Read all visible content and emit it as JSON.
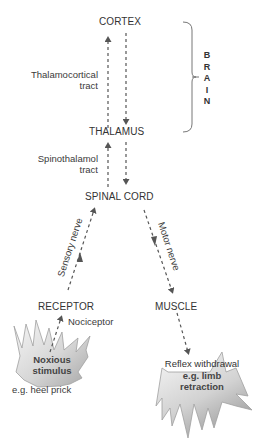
{
  "nodes": {
    "cortex": "CORTEX",
    "thalamus": "THALAMUS",
    "spinal_cord": "SPINAL CORD",
    "receptor": "RECEPTOR",
    "muscle": "MUSCLE"
  },
  "tracts": {
    "thalamocortical_line1": "Thalamocortical",
    "thalamocortical_line2": "tract",
    "spinothalamic_line1": "Spinothalamol",
    "spinothalamic_line2": "tract",
    "sensory_nerve": "Sensory nerve",
    "motor_nerve": "Motor nerve"
  },
  "brain_group": {
    "letters": [
      "B",
      "R",
      "A",
      "I",
      "N"
    ]
  },
  "stimulus": {
    "nociceptor": "Nociceptor",
    "line1": "Noxious",
    "line2": "stimulus",
    "example": "e.g. heel prick"
  },
  "response": {
    "line1": "Reflex withdrawal",
    "line2": "e.g. limb",
    "line3": "retraction"
  },
  "colors": {
    "arrow": "#555555",
    "burst_fill_light": "#f4f4f4",
    "burst_fill_dark": "#a8a8a8",
    "burst_stroke": "#9a9a9a"
  }
}
